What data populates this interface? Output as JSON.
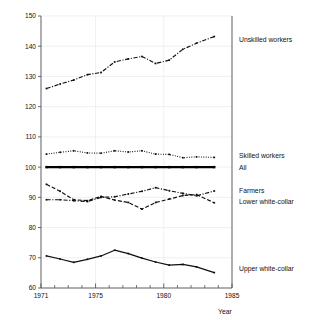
{
  "chart_data": {
    "type": "line",
    "title": "",
    "xlabel": "Year",
    "ylabel": "",
    "xlim": [
      1971,
      1985
    ],
    "ylim": [
      60,
      150
    ],
    "grid": true,
    "legend_position": "right-inline",
    "x_major_ticks": [
      1971,
      1975,
      1980,
      1985
    ],
    "x_major_tick_labels": [
      "1971",
      "1975",
      "1980",
      "1985"
    ],
    "x_minor_ticks": [
      1972,
      1973,
      1974,
      1976,
      1977,
      1978,
      1979,
      1981,
      1982,
      1983,
      1984
    ],
    "y_ticks": [
      60,
      70,
      80,
      90,
      100,
      110,
      120,
      130,
      140,
      150
    ],
    "y_tick_labels": [
      "60",
      "70",
      "80",
      "90",
      "100",
      "110",
      "120",
      "130",
      "140",
      "150"
    ],
    "x": [
      1971.4,
      1972.4,
      1973.4,
      1974.4,
      1975.4,
      1976.4,
      1977.4,
      1978.4,
      1979.4,
      1980.4,
      1981.4,
      1982.4,
      1983.7
    ],
    "series": [
      {
        "name": "Unskilled workers",
        "style": "dash-dot",
        "color": "#101010",
        "values": [
          126.0,
          127.5,
          128.8,
          130.6,
          131.3,
          134.8,
          135.8,
          136.6,
          134.3,
          135.4,
          139.0,
          141.0,
          143.2
        ]
      },
      {
        "name": "Skilled workers",
        "style": "dotted",
        "color": "#101010",
        "values": [
          104.3,
          104.9,
          105.4,
          104.7,
          104.6,
          105.4,
          105.0,
          105.4,
          104.3,
          104.2,
          103.1,
          103.4,
          103.2
        ]
      },
      {
        "name": "All",
        "style": "solid-thick",
        "color": "#000000",
        "values": [
          100.0,
          100.0,
          100.0,
          100.0,
          100.0,
          100.0,
          100.0,
          100.0,
          100.0,
          100.0,
          100.0,
          100.0,
          100.0
        ]
      },
      {
        "name": "Farmers",
        "style": "dash-dot",
        "color": "#101010",
        "values": [
          89.2,
          89.2,
          88.9,
          88.6,
          90.0,
          90.2,
          91.1,
          92.0,
          93.2,
          92.2,
          91.3,
          90.5,
          92.1
        ]
      },
      {
        "name": "Lower white-collar",
        "style": "dashed",
        "color": "#101010",
        "values": [
          94.3,
          92.0,
          89.2,
          88.9,
          90.3,
          89.1,
          88.3,
          86.1,
          88.3,
          89.4,
          90.6,
          90.9,
          88.2
        ]
      },
      {
        "name": "Upper white-collar",
        "style": "solid",
        "color": "#101010",
        "values": [
          70.6,
          69.6,
          68.5,
          69.5,
          70.6,
          72.5,
          71.4,
          69.9,
          68.6,
          67.6,
          67.8,
          67.0,
          65.1
        ]
      }
    ],
    "series_label_positions": [
      {
        "name": "Unskilled workers",
        "y_value": 142.0
      },
      {
        "name": "Skilled workers",
        "y_value": 103.8
      },
      {
        "name": "All",
        "y_value": 99.6
      },
      {
        "name": "Farmers",
        "y_value": 92.0
      },
      {
        "name": "Lower white-collar",
        "y_value": 88.4
      },
      {
        "name": "Upper white-collar",
        "y_value": 66.2
      }
    ]
  }
}
